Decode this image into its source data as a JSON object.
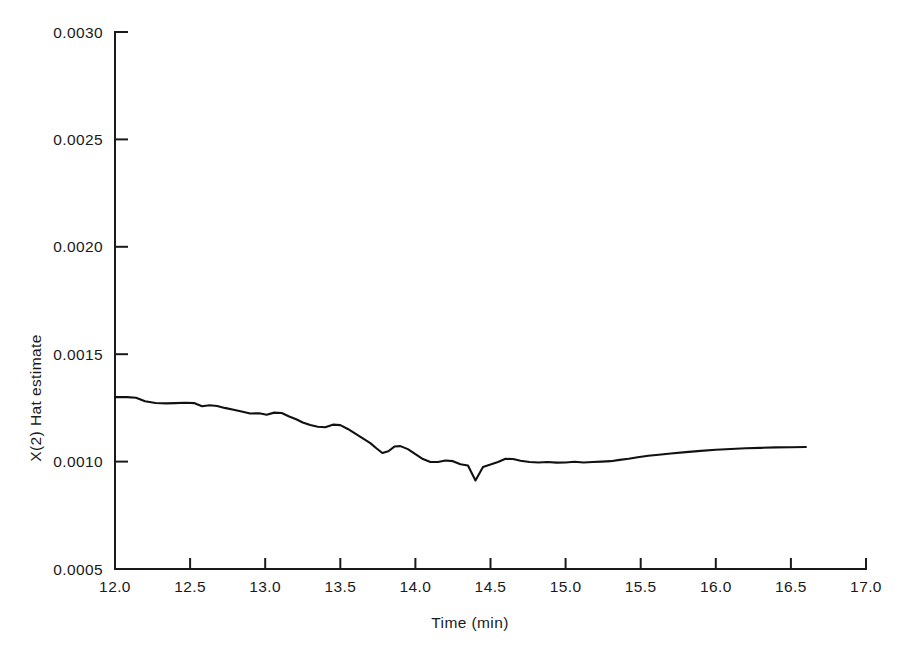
{
  "chart_data": {
    "type": "line",
    "title": "",
    "subtitle": "",
    "xlabel": "Time (min)",
    "ylabel": "X(2) Hat estimate",
    "xlim": [
      12.0,
      17.0
    ],
    "ylim": [
      0.0005,
      0.003
    ],
    "grid": false,
    "legend": null,
    "legend_position": "none",
    "x_ticks": [
      12.0,
      12.5,
      13.0,
      13.5,
      14.0,
      14.5,
      15.0,
      15.5,
      16.0,
      16.5,
      17.0
    ],
    "x_tick_labels": [
      "12.0",
      "12.5",
      "13.0",
      "13.5",
      "14.0",
      "14.5",
      "15.0",
      "15.5",
      "16.0",
      "16.5",
      "17.0"
    ],
    "y_ticks": [
      0.0005,
      0.001,
      0.0015,
      0.002,
      0.0025,
      0.003
    ],
    "y_tick_labels": [
      "0.0005",
      "0.0010",
      "0.0015",
      "0.0020",
      "0.0025",
      "0.0030"
    ],
    "series": [
      {
        "name": "X(2) Hat estimate",
        "color": "#111111",
        "x": [
          12.0,
          12.08,
          12.14,
          12.2,
          12.27,
          12.34,
          12.4,
          12.47,
          12.53,
          12.58,
          12.63,
          12.68,
          12.73,
          12.79,
          12.85,
          12.9,
          12.96,
          13.01,
          13.06,
          13.11,
          13.16,
          13.21,
          13.25,
          13.3,
          13.35,
          13.4,
          13.45,
          13.5,
          13.55,
          13.6,
          13.65,
          13.7,
          13.74,
          13.78,
          13.82,
          13.86,
          13.9,
          13.95,
          14.0,
          14.05,
          14.1,
          14.15,
          14.2,
          14.25,
          14.3,
          14.35,
          14.4,
          14.45,
          14.5,
          14.55,
          14.6,
          14.65,
          14.7,
          14.76,
          14.82,
          14.88,
          14.94,
          15.0,
          15.06,
          15.12,
          15.18,
          15.24,
          15.3,
          15.36,
          15.42,
          15.48,
          15.55,
          15.62,
          15.7,
          15.8,
          15.9,
          16.0,
          16.1,
          16.2,
          16.3,
          16.4,
          16.5,
          16.6
        ],
        "y": [
          0.0013,
          0.0013,
          0.001297,
          0.001281,
          0.001273,
          0.001271,
          0.001272,
          0.001274,
          0.001272,
          0.001258,
          0.001262,
          0.001259,
          0.00125,
          0.001241,
          0.001232,
          0.001224,
          0.001225,
          0.001218,
          0.001228,
          0.001226,
          0.00121,
          0.001196,
          0.001182,
          0.00117,
          0.001162,
          0.00116,
          0.001172,
          0.00117,
          0.001152,
          0.00113,
          0.001108,
          0.001086,
          0.001062,
          0.00104,
          0.001048,
          0.00107,
          0.001072,
          0.001058,
          0.001035,
          0.001012,
          0.000998,
          0.000998,
          0.001005,
          0.001002,
          0.000988,
          0.000982,
          0.000912,
          0.000975,
          0.000986,
          0.000998,
          0.001013,
          0.001012,
          0.001004,
          0.000998,
          0.000996,
          0.000998,
          0.000995,
          0.000996,
          0.000999,
          0.000996,
          0.000998,
          0.001,
          0.001002,
          0.001008,
          0.001013,
          0.00102,
          0.001027,
          0.001032,
          0.001038,
          0.001044,
          0.00105,
          0.001055,
          0.001059,
          0.001062,
          0.001064,
          0.001066,
          0.001067,
          0.001068
        ]
      }
    ],
    "annotations": []
  }
}
